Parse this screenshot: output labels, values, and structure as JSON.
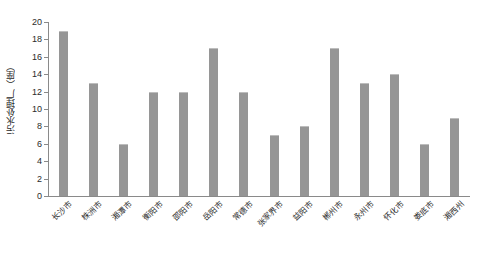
{
  "chart_data": {
    "type": "bar",
    "title": "",
    "subtitle": "",
    "xlabel": "",
    "ylabel": "污水处理厂（座）",
    "categories": [
      "长沙市",
      "株洲市",
      "湘潭市",
      "衡阳市",
      "邵阳市",
      "岳阳市",
      "常德市",
      "张家界市",
      "益阳市",
      "郴州市",
      "永州市",
      "怀化市",
      "娄底市",
      "湘西州"
    ],
    "values": [
      19,
      13,
      6,
      12,
      12,
      17,
      12,
      7,
      8,
      17,
      13,
      14,
      6,
      9
    ],
    "ylim": [
      0,
      20
    ],
    "ytick_labels": [
      "0",
      "2",
      "4",
      "6",
      "8",
      "10",
      "12",
      "14",
      "16",
      "18",
      "20"
    ],
    "ytick_values": [
      0,
      2,
      4,
      6,
      8,
      10,
      12,
      14,
      16,
      18,
      20
    ],
    "grid": false,
    "legend": null,
    "legend_position": "none",
    "bar_color": "#969696",
    "axis_color": "#8a8a8a",
    "text_color": "#2b2b2b",
    "background_color": "#ffffff"
  }
}
